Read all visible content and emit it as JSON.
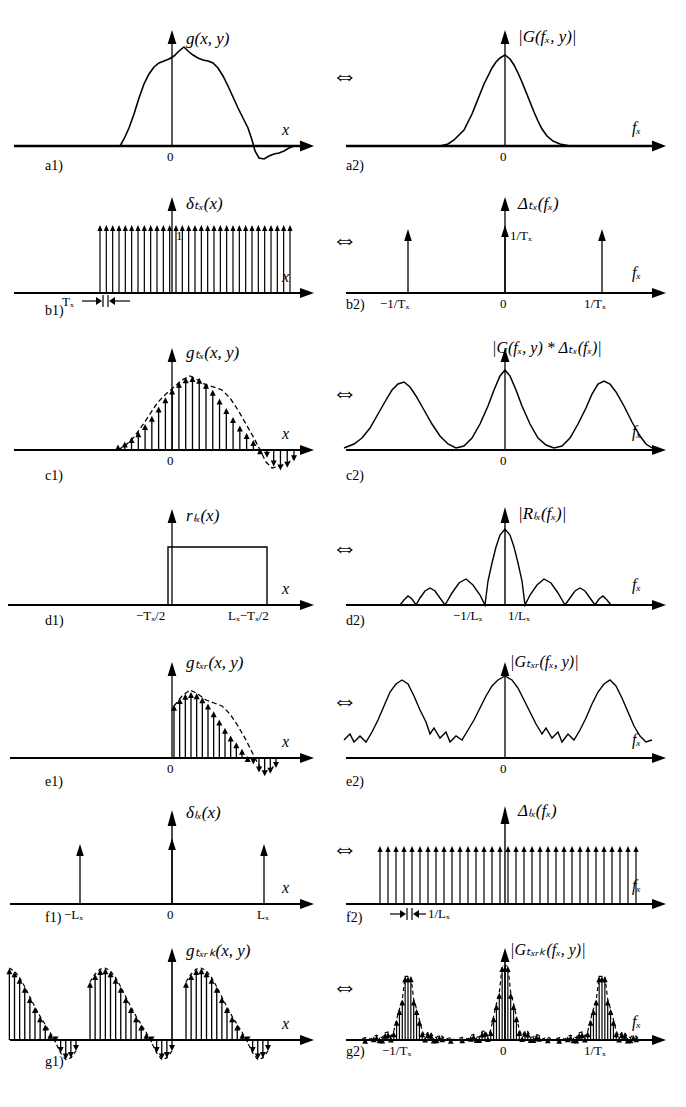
{
  "figure": {
    "equivalence_symbol": "⇔",
    "axis_x_label": "x",
    "axis_f_label": "f",
    "axis_f_sub": "x",
    "zero_label": "0"
  },
  "rows": [
    {
      "id": "a",
      "left": {
        "panel_id": "a1)",
        "function_label": "g(x, y)",
        "axis_label": "x",
        "ticks": [
          "0"
        ],
        "type": "continuous-signal"
      },
      "right": {
        "panel_id": "a2)",
        "function_label": "|G(fₓ, y)|",
        "axis_label": "fₓ",
        "ticks": [
          "0"
        ],
        "type": "continuous-spectrum"
      }
    },
    {
      "id": "b",
      "left": {
        "panel_id": "b1)",
        "function_label": "δₜₓ(x)",
        "axis_label": "x",
        "amplitude_label": "1",
        "spacing_label": "Tₓ",
        "ticks": [],
        "type": "dirac-comb"
      },
      "right": {
        "panel_id": "b2)",
        "function_label": "Δₜₓ(fₓ)",
        "axis_label": "fₓ",
        "amplitude_label": "1/Tₓ",
        "ticks": [
          "−1/Tₓ",
          "0",
          "1/Tₓ"
        ],
        "type": "sparse-comb"
      }
    },
    {
      "id": "c",
      "left": {
        "panel_id": "c1)",
        "function_label": "gₜₓ(x, y)",
        "axis_label": "x",
        "ticks": [
          "0"
        ],
        "type": "sampled-signal"
      },
      "right": {
        "panel_id": "c2)",
        "function_label": "|G(fₓ, y) * Δₜₓ(fₓ)|",
        "axis_label": "fₓ",
        "ticks": [
          "0"
        ],
        "type": "periodic-spectrum"
      }
    },
    {
      "id": "d",
      "left": {
        "panel_id": "d1)",
        "function_label": "rₗₓ(x)",
        "axis_label": "x",
        "ticks": [
          "−Tₓ/2",
          "Lₓ−Tₓ/2"
        ],
        "type": "rect-window"
      },
      "right": {
        "panel_id": "d2)",
        "function_label": "|Rₗₓ(fₓ)|",
        "axis_label": "fₓ",
        "ticks": [
          "−1/Lₓ",
          "1/Lₓ"
        ],
        "type": "sinc"
      }
    },
    {
      "id": "e",
      "left": {
        "panel_id": "e1)",
        "function_label": "gₜₓᵣ(x, y)",
        "axis_label": "x",
        "ticks": [
          "0"
        ],
        "type": "truncated-sampled-signal"
      },
      "right": {
        "panel_id": "e2)",
        "function_label": "|Gₜₓᵣ(fₓ, y)|",
        "axis_label": "fₓ",
        "ticks": [
          "0"
        ],
        "type": "rippled-spectrum"
      }
    },
    {
      "id": "f",
      "left": {
        "panel_id": "f1)",
        "function_label": "δₗₓ(x)",
        "axis_label": "x",
        "ticks": [
          "−Lₓ",
          "0",
          "Lₓ"
        ],
        "type": "sparse-comb"
      },
      "right": {
        "panel_id": "f2)",
        "function_label": "Δₗₓ(fₓ)",
        "axis_label": "fₓ",
        "spacing_label": "1/Lₓ",
        "ticks": [],
        "type": "dense-comb"
      }
    },
    {
      "id": "g",
      "left": {
        "panel_id": "g1)",
        "function_label": "gₜₓᵣₖ(x, y)",
        "axis_label": "x",
        "ticks": [],
        "type": "periodic-sampled-signal"
      },
      "right": {
        "panel_id": "g2)",
        "function_label": "|Gₜₓᵣₖ(fₓ, y)|",
        "axis_label": "fₓ",
        "ticks": [
          "−1/Tₓ",
          "0",
          "1/Tₓ"
        ],
        "type": "discrete-periodic-spectrum"
      }
    }
  ],
  "chart_data": {
    "type": "line",
    "xlabel": "x",
    "ylabel": "amplitude",
    "grid": false,
    "legend": "none",
    "panels": [
      {
        "id": "a1",
        "label": "g(x, y)",
        "kind": "continuous",
        "domain": "space",
        "x": [
          -0.58,
          -0.52,
          -0.46,
          -0.4,
          -0.34,
          -0.28,
          -0.22,
          -0.16,
          -0.1,
          -0.04,
          0.02,
          0.08,
          0.14,
          0.2,
          0.26,
          0.32,
          0.38,
          0.44,
          0.5,
          0.56,
          0.62,
          0.68,
          0.74,
          0.8,
          0.86,
          0.92,
          0.98
        ],
        "values": [
          0.0,
          0.02,
          0.08,
          0.2,
          0.36,
          0.52,
          0.66,
          0.76,
          0.82,
          0.88,
          0.95,
          1.0,
          0.93,
          0.88,
          0.86,
          0.84,
          0.78,
          0.66,
          0.52,
          0.36,
          0.18,
          0.02,
          -0.12,
          -0.18,
          -0.14,
          -0.1,
          -0.06
        ]
      },
      {
        "id": "a2",
        "label": "|G(f_x, y)|",
        "kind": "continuous",
        "domain": "frequency",
        "x": [
          -1.0,
          -0.8,
          -0.6,
          -0.5,
          -0.4,
          -0.3,
          -0.22,
          -0.15,
          -0.08,
          0.0,
          0.08,
          0.15,
          0.22,
          0.3,
          0.4,
          0.5,
          0.6,
          0.8,
          1.0
        ],
        "values": [
          0.0,
          0.02,
          0.06,
          0.12,
          0.22,
          0.38,
          0.58,
          0.78,
          0.95,
          1.0,
          0.93,
          0.74,
          0.54,
          0.36,
          0.2,
          0.11,
          0.05,
          0.01,
          0.0
        ]
      },
      {
        "id": "b1",
        "label": "delta_Tx(x)",
        "kind": "impulse-train",
        "domain": "space",
        "amplitude": 1,
        "spacing": "T_x",
        "count": 31,
        "values": [
          1,
          1,
          1,
          1,
          1,
          1,
          1,
          1,
          1,
          1,
          1,
          1,
          1,
          1,
          1,
          1,
          1,
          1,
          1,
          1,
          1,
          1,
          1,
          1,
          1,
          1,
          1,
          1,
          1,
          1,
          1
        ]
      },
      {
        "id": "b2",
        "label": "Delta_Tx(f_x)",
        "kind": "impulse-train",
        "domain": "frequency",
        "amplitude": "1/T_x",
        "x": [
          -1,
          0,
          1
        ],
        "tick_labels": [
          "-1/T_x",
          "0",
          "1/T_x"
        ],
        "values": [
          0.78,
          1.0,
          0.78
        ]
      },
      {
        "id": "c1",
        "label": "g_Tx(x, y)",
        "kind": "sampled",
        "domain": "space",
        "envelope_from": "a1",
        "n_samples": 27
      },
      {
        "id": "c2",
        "label": "|G(f_x, y) * Delta_Tx(f_x)|",
        "kind": "periodic-continuous",
        "domain": "frequency",
        "replicas_at": [
          -1,
          0,
          1
        ],
        "replica_peaks": [
          0.8,
          1.0,
          0.8
        ]
      },
      {
        "id": "d1",
        "label": "r_Lx(x)",
        "kind": "rect",
        "domain": "space",
        "start": "-T_x/2",
        "end": "L_x - T_x/2",
        "amplitude": 1
      },
      {
        "id": "d2",
        "label": "|R_Lx(f_x)|",
        "kind": "sinc",
        "domain": "frequency",
        "first_nulls": [
          "-1/L_x",
          "1/L_x"
        ],
        "main_lobe_peak": 1.0,
        "side_lobe_peaks": [
          0.21,
          0.13,
          0.09
        ]
      },
      {
        "id": "e1",
        "label": "g_Txr(x, y)",
        "kind": "sampled-truncated",
        "domain": "space",
        "n_samples": 19
      },
      {
        "id": "e2",
        "label": "|G_Txr(f_x, y)|",
        "kind": "periodic-rippled",
        "domain": "frequency",
        "replicas_at": [
          -1,
          0,
          1
        ],
        "replica_peaks": [
          0.8,
          1.0,
          0.8
        ],
        "ripple_amplitude": 0.18
      },
      {
        "id": "f1",
        "label": "delta_Lx(x)",
        "kind": "impulse-train",
        "domain": "space",
        "x": [
          -1,
          0,
          1
        ],
        "tick_labels": [
          "-L_x",
          "0",
          "L_x"
        ],
        "values": [
          0.62,
          1.0,
          0.62
        ]
      },
      {
        "id": "f2",
        "label": "Delta_Lx(f_x)",
        "kind": "impulse-train",
        "domain": "frequency",
        "spacing": "1/L_x",
        "count": 33
      },
      {
        "id": "g1",
        "label": "g_Txrk(x, y)",
        "kind": "periodic-sampled",
        "domain": "space",
        "periods": 3
      },
      {
        "id": "g2",
        "label": "|G_Txrk(f_x, y)|",
        "kind": "discrete-periodic",
        "domain": "frequency",
        "replicas_at": [
          -1,
          0,
          1
        ],
        "tick_labels": [
          "-1/T_x",
          "0",
          "1/T_x"
        ]
      }
    ]
  }
}
